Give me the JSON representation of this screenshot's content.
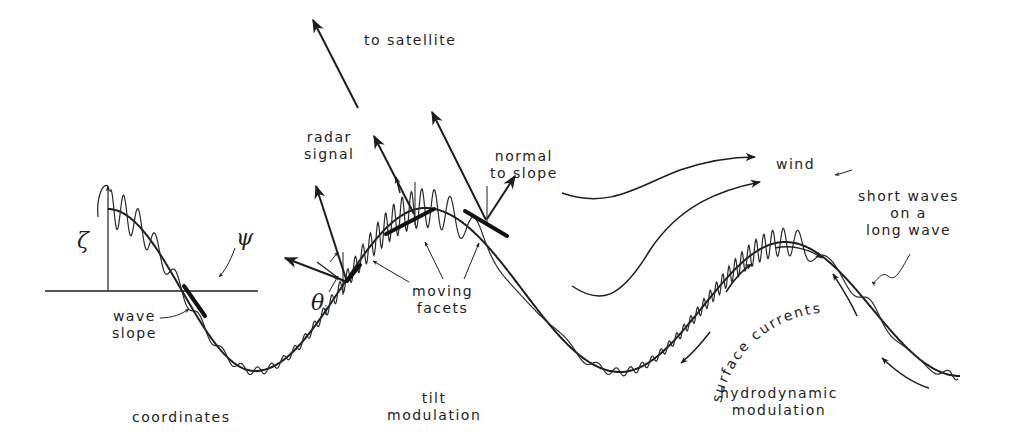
{
  "diagram": {
    "type": "schematic",
    "colors": {
      "ink": "#1e1e1e",
      "background": "#ffffff"
    }
  },
  "labels": {
    "to_satellite": "to satellite",
    "radar_signal": "radar\nsignal",
    "normal_to_slope": "normal\nto slope",
    "wind": "wind",
    "short_waves": "short waves\non a\nlong wave",
    "moving_facets": "moving\nfacets",
    "wave_slope": "wave\nslope",
    "surface_currents": "surface currents",
    "coordinates": "coordinates",
    "tilt_modulation": "tilt\nmodulation",
    "hydrodynamic_modulation": "hydrodynamic\nmodulation"
  },
  "symbols": {
    "zeta": "ζ",
    "psi": "ψ",
    "theta": "θ",
    "theta_sub": "i"
  },
  "panels": [
    {
      "name": "coordinates",
      "elements": [
        "elevation axis ζ",
        "horizontal axis ψ",
        "wave slope facet"
      ]
    },
    {
      "name": "tilt modulation",
      "elements": [
        "radar signal arrows",
        "normal to slope arrows",
        "incidence angle θi",
        "moving facets"
      ]
    },
    {
      "name": "hydrodynamic modulation",
      "elements": [
        "wind arrows",
        "surface currents arrows",
        "short waves on a long wave"
      ]
    }
  ]
}
